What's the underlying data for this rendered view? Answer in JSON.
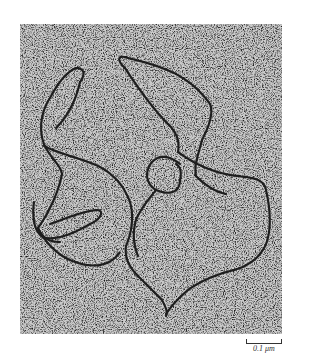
{
  "figure": {
    "background_color": "#b9b9b9",
    "strand_color": "#2a2a2a"
  },
  "scale_bar": {
    "label": "0.1 μm"
  }
}
